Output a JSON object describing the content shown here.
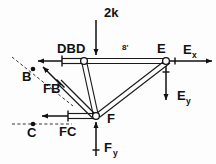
{
  "diagram": {
    "type": "free-body-diagram",
    "background_color": "#fdfdfd",
    "line_color": "#111111",
    "joints": [
      {
        "id": "B",
        "label": "B",
        "kind": "point-marker",
        "x": 33,
        "y": 69
      },
      {
        "id": "C",
        "label": "C",
        "kind": "point-marker",
        "x": 33,
        "y": 124
      },
      {
        "id": "D",
        "label": "D",
        "kind": "pin-joint",
        "x": 84,
        "y": 61
      },
      {
        "id": "E",
        "label": "E",
        "kind": "pin-joint",
        "x": 166,
        "y": 61
      },
      {
        "id": "F",
        "label": "F",
        "kind": "pin-joint",
        "x": 96,
        "y": 116
      }
    ],
    "members": [
      {
        "id": "DE",
        "from": "D",
        "to": "E",
        "style": "double-line"
      },
      {
        "id": "DF",
        "from": "D",
        "to": "F",
        "style": "double-line"
      },
      {
        "id": "FE",
        "from": "F",
        "to": "E",
        "style": "double-line"
      },
      {
        "id": "FB-stub",
        "from": "F",
        "to": "B",
        "style": "double-line"
      },
      {
        "id": "FC-stub",
        "from": "F",
        "to": "C",
        "style": "double-line"
      },
      {
        "id": "DB-stub",
        "from": "D",
        "to": "B",
        "style": "double-line"
      }
    ],
    "member_force_labels": [
      {
        "id": "DB",
        "label": "DB",
        "x": 57,
        "y": 53
      },
      {
        "id": "FB",
        "label": "FB",
        "x": 43,
        "y": 93
      },
      {
        "id": "FC",
        "label": "FC",
        "x": 59,
        "y": 136
      }
    ],
    "applied_loads": [
      {
        "id": "load-2k",
        "label": "2k",
        "value": "2k",
        "direction": "down",
        "at_joint": "D",
        "label_x": 104,
        "label_y": 17
      }
    ],
    "reactions": [
      {
        "id": "Ex",
        "base": "E",
        "sub": "x",
        "direction": "right",
        "at_joint": "E",
        "label_x": 183,
        "label_y": 54
      },
      {
        "id": "Ey",
        "base": "E",
        "sub": "y",
        "direction": "down",
        "at_joint": "E",
        "label_x": 177,
        "label_y": 100
      },
      {
        "id": "Fy",
        "base": "F",
        "sub": "y",
        "direction": "up",
        "at_joint": "F",
        "label_x": 107,
        "label_y": 152
      }
    ],
    "dimensions": [
      {
        "id": "span-DE",
        "label": "8'",
        "between": [
          "D",
          "E"
        ],
        "x": 122,
        "y": 50
      }
    ],
    "node_labels": {
      "B": "B",
      "C": "C",
      "D": "D",
      "E": "E",
      "F": "F"
    }
  }
}
